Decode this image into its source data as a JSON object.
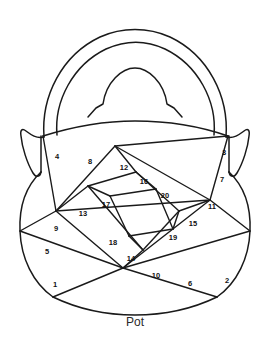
{
  "figure": {
    "caption": "Pot",
    "subject": "pot",
    "stroke_color": "#1a1a1a",
    "background_color": "#ffffff",
    "label_color": "#111111",
    "caption_color": "#2a2a2a",
    "region_count": 20
  },
  "regions": [
    {
      "id": 1,
      "label": "1",
      "x": 55,
      "y": 285
    },
    {
      "id": 2,
      "label": "2",
      "x": 227,
      "y": 281
    },
    {
      "id": 3,
      "label": "3",
      "x": 224,
      "y": 153
    },
    {
      "id": 4,
      "label": "4",
      "x": 57,
      "y": 157
    },
    {
      "id": 5,
      "label": "5",
      "x": 47,
      "y": 252
    },
    {
      "id": 6,
      "label": "6",
      "x": 190,
      "y": 284
    },
    {
      "id": 7,
      "label": "7",
      "x": 222,
      "y": 180
    },
    {
      "id": 8,
      "label": "8",
      "x": 90,
      "y": 162
    },
    {
      "id": 9,
      "label": "9",
      "x": 56,
      "y": 229
    },
    {
      "id": 10,
      "label": "10",
      "x": 156,
      "y": 276
    },
    {
      "id": 11,
      "label": "11",
      "x": 212,
      "y": 207
    },
    {
      "id": 12,
      "label": "12",
      "x": 124,
      "y": 168
    },
    {
      "id": 13,
      "label": "13",
      "x": 83,
      "y": 214
    },
    {
      "id": 14,
      "label": "14",
      "x": 131,
      "y": 259
    },
    {
      "id": 15,
      "label": "15",
      "x": 193,
      "y": 224
    },
    {
      "id": 16,
      "label": "16",
      "x": 144,
      "y": 182
    },
    {
      "id": 17,
      "label": "17",
      "x": 106,
      "y": 205
    },
    {
      "id": 18,
      "label": "18",
      "x": 113,
      "y": 243
    },
    {
      "id": 19,
      "label": "19",
      "x": 173,
      "y": 238
    },
    {
      "id": 20,
      "label": "20",
      "x": 165,
      "y": 196
    }
  ],
  "shapes": {
    "handle_outer": "M 44 137 C 41 96 62 55 100 37 C 122 27 148 27 170 37 C 208 55 229 96 226 137",
    "handle_inner": "M 57 135 C 54 101 73 65 106 49 C 126 40 146 40 165 49 C 198 65 217 101 214 135",
    "lid_dome": "M 88 117 L 96 108 L 103 104 C 106 82 122 68 135 68 C 148 68 164 82 167 104 L 174 108 L 182 117",
    "left_ear": "M 44 137 C 36 139 30 134 26 131 C 22 128 20 130 21 136 C 22 147 27 163 33 173 C 36 178 40 177 41 172",
    "right_ear": "M 226 137 C 234 139 240 134 244 131 C 248 128 250 130 249 136 C 248 147 243 163 237 173 C 234 178 230 177 229 172",
    "body_left": "M 41 172 C 26 186 19 207 20 231 C 21 258 33 283 53 297",
    "body_right": "M 229 172 C 244 186 251 207 250 231 C 249 258 237 283 217 297",
    "body_bottom": "M 53 297 C 80 310 110 315 135 315 C 160 315 190 310 217 297",
    "rim_left_tick": "M 41 172 L 41 136",
    "rim_right_tick": "M 229 172 L 229 136",
    "rim_line": "M 43 136 C 75 126 105 121 135 121 C 168 121 202 127 228 136"
  },
  "dividers": [
    "M 43 136 L 56 211",
    "M 56 211 L 115 146",
    "M 115 146 L 228 136",
    "M 115 146 L 210 200",
    "M 210 200 L 56 211",
    "M 210 200 L 228 136",
    "M 56 211 L 123 268",
    "M 123 268 L 210 200",
    "M 123 268 L 53 297",
    "M 123 268 L 217 297",
    "M 20 231 L 56 211",
    "M 20 231 L 123 268",
    "M 250 231 L 210 200",
    "M 250 231 L 123 268",
    "M 88 186 L 136 172",
    "M 136 172 L 179 211",
    "M 179 211 L 143 250",
    "M 143 250 L 88 186",
    "M 88 186 L 56 211",
    "M 136 172 L 115 146",
    "M 179 211 L 210 200",
    "M 143 250 L 123 268",
    "M 110 196 L 156 189",
    "M 156 189 L 173 229",
    "M 173 229 L 129 236",
    "M 129 236 L 110 196",
    "M 110 196 L 88 186",
    "M 156 189 L 136 172",
    "M 173 229 L 179 211",
    "M 129 236 L 143 250"
  ],
  "caption_position": {
    "x": 135,
    "y": 323
  }
}
